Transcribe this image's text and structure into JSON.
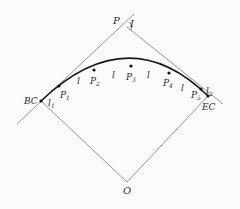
{
  "diagram": {
    "type": "circular curve layout (tangent offset / chord stakeout)",
    "labels": {
      "vertex": "P",
      "deflection_angle": "I",
      "begin_curve": "BC",
      "end_curve": "EC",
      "center": "O",
      "points": [
        {
          "base": "P",
          "sub": "1"
        },
        {
          "base": "P",
          "sub": "2"
        },
        {
          "base": "P",
          "sub": "3"
        },
        {
          "base": "P",
          "sub": "4"
        },
        {
          "base": "P",
          "sub": "5"
        }
      ],
      "first_arc": {
        "base": "l",
        "sub": "1"
      },
      "last_arc": {
        "base": "l",
        "sub": "2"
      },
      "arc_length": "l"
    },
    "colors": {
      "background": "#fbfbfb",
      "lines": "#7a7a7a",
      "curve": "#1a1a1a",
      "text": "#2a2a2a"
    }
  }
}
